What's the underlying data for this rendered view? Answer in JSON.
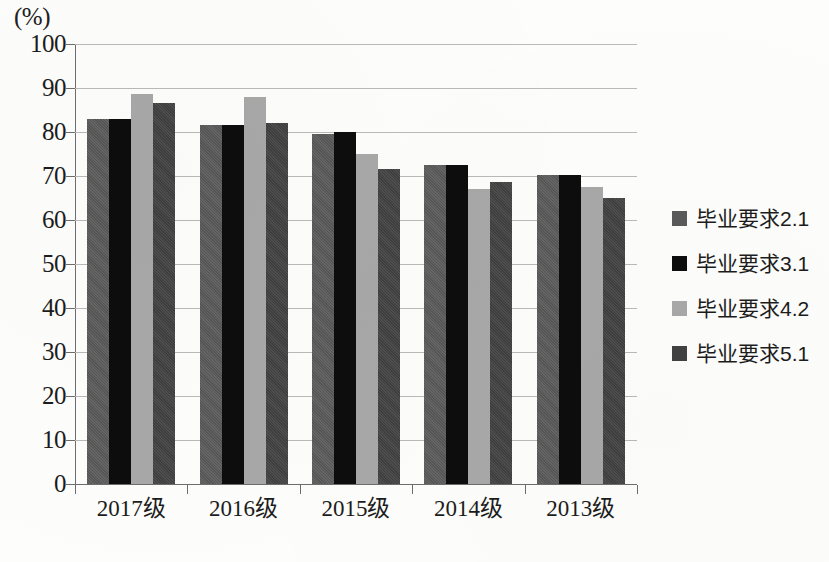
{
  "chart_data": {
    "type": "bar",
    "title": "",
    "subtitle": "",
    "xlabel": "",
    "ylabel": "(%)",
    "unit_label": "(%)",
    "categories": [
      "2017级",
      "2016级",
      "2015级",
      "2014级",
      "2013级"
    ],
    "series": [
      {
        "name": "毕业要求2.1",
        "color": "#5a5a5a",
        "values": [
          83.0,
          81.7,
          79.5,
          72.4,
          70.2
        ]
      },
      {
        "name": "毕业要求3.1",
        "color": "#0d0d0d",
        "values": [
          83.0,
          81.7,
          80.0,
          72.4,
          70.3
        ]
      },
      {
        "name": "毕业要求4.2",
        "color": "#a8a8a8",
        "values": [
          88.7,
          88.0,
          75.0,
          67.0,
          67.5
        ]
      },
      {
        "name": "毕业要求5.1",
        "color": "#414141",
        "values": [
          86.5,
          82.0,
          71.5,
          68.7,
          65.0
        ]
      }
    ],
    "ylim": [
      0,
      100
    ],
    "y_ticks": [
      "0",
      "10",
      "20",
      "30",
      "40",
      "50",
      "60",
      "70",
      "80",
      "90",
      "100"
    ],
    "y_tick_values": [
      0,
      10,
      20,
      30,
      40,
      50,
      60,
      70,
      80,
      90,
      100
    ],
    "grid": true,
    "grid_axis": "y",
    "legend_position": "right",
    "legend_entries": [
      "毕业要求2.1",
      "毕业要求3.1",
      "毕业要求4.2",
      "毕业要求5.1"
    ],
    "background_color": "#fdfdfb",
    "axis_color": "#6d6d6d",
    "grid_color": "#b9b9b9"
  }
}
